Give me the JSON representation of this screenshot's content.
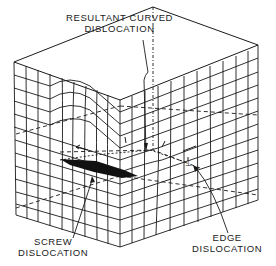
{
  "figure": {
    "labels": {
      "resultant_line1": "RESULTANT CURVED",
      "resultant_line2": "DISLOCATION",
      "screw_line1": "SCREW",
      "screw_line2": "DISLOCATION",
      "edge_line1": "EDGE",
      "edge_line2": "DISLOCATION"
    },
    "colors": {
      "line": "#1a1a1a",
      "background": "#ffffff",
      "slip_region": "#111111"
    }
  }
}
